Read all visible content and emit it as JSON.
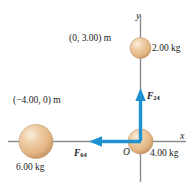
{
  "figure": {
    "background_color": "#ffffff",
    "axis_color": "#8c8c8c",
    "vector_color": "#1e92d0",
    "sphere_color_light": "#f3d9ba",
    "sphere_color_mid": "#e4b98c",
    "sphere_color_dark": "#c99a68",
    "text_color": "#1a1a1a"
  },
  "axes": {
    "x_label": "x",
    "y_label": "y",
    "origin_label": "O"
  },
  "masses": [
    {
      "id": "mass-2kg",
      "label": "2.00 kg",
      "coordinate_label": "(0, 3.00) m",
      "position": {
        "x": 0,
        "y": 3.0
      },
      "units": "m"
    },
    {
      "id": "mass-4kg",
      "label": "4.00 kg",
      "coordinate_label": "",
      "position": {
        "x": 0,
        "y": 0
      },
      "units": "m"
    },
    {
      "id": "mass-6kg",
      "label": "6.00 kg",
      "coordinate_label": "(−4.00, 0) m",
      "position": {
        "x": -4.0,
        "y": 0
      },
      "units": "m"
    }
  ],
  "forces": [
    {
      "id": "force-24",
      "symbol": "F",
      "subscript": "24",
      "direction": "up",
      "description": "force on 4.00 kg from 2.00 kg"
    },
    {
      "id": "force-64",
      "symbol": "F",
      "subscript": "64",
      "direction": "left",
      "description": "force on 4.00 kg from 6.00 kg"
    }
  ]
}
